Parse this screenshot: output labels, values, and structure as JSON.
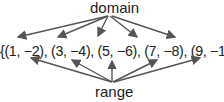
{
  "diagram": {
    "top_label": "domain",
    "bottom_label": "range",
    "set_text": "{(1, −2), (3, −4), (5, −6), (7, −8), (9, −10)}",
    "pairs": [
      {
        "x": "1",
        "y": "−2"
      },
      {
        "x": "3",
        "y": "−4"
      },
      {
        "x": "5",
        "y": "−6"
      },
      {
        "x": "7",
        "y": "−8"
      },
      {
        "x": "9",
        "y": "−10"
      }
    ],
    "arrow_color": "#555555"
  }
}
